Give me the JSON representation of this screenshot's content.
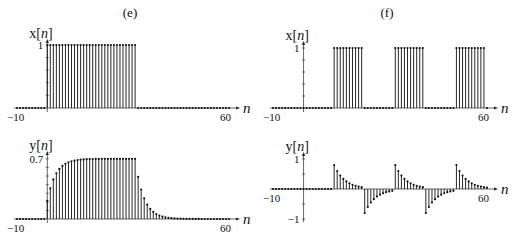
{
  "panels": [
    {
      "id": "e",
      "label": "(e)"
    },
    {
      "id": "f",
      "label": "(f)"
    }
  ],
  "chart_data": [
    {
      "type": "stem",
      "panel": "(e)",
      "title": "x[n]",
      "ylabel": "x[n]",
      "xlabel": "n",
      "xlim": [
        -10,
        60
      ],
      "x_tick_labels": [
        "-10",
        "60"
      ],
      "y_tick_labels": [
        "1"
      ],
      "ylim": [
        0,
        1
      ],
      "description": "Rectangular pulse: x[n]=1 for 0<=n<=29, else 0",
      "pulse": {
        "start": 0,
        "end": 29,
        "amplitude": 1
      }
    },
    {
      "type": "stem",
      "panel": "(e)",
      "title": "y[n]",
      "ylabel": "y[n]",
      "xlabel": "n",
      "xlim": [
        -10,
        60
      ],
      "x_tick_labels": [
        "-10",
        "60"
      ],
      "y_tick_labels": [
        "0.7"
      ],
      "ylim": [
        0,
        0.7
      ],
      "description": "First-order response: rises toward 0.7 from n=0, decays after n=29",
      "model": {
        "steady_state": 0.7,
        "pole": 0.7,
        "on_start": 0,
        "on_end": 29
      }
    },
    {
      "type": "stem",
      "panel": "(f)",
      "title": "x[n]",
      "ylabel": "x[n]",
      "xlabel": "n",
      "xlim": [
        -10,
        60
      ],
      "x_tick_labels": [
        "-10",
        "60"
      ],
      "y_tick_labels": [
        "1"
      ],
      "ylim": [
        0,
        1
      ],
      "description": "Periodic pulse train: x[n]=1 for n in [10,19],[30,39],[50,59]",
      "pulses": [
        [
          10,
          19
        ],
        [
          30,
          39
        ],
        [
          50,
          59
        ]
      ]
    },
    {
      "type": "stem",
      "panel": "(f)",
      "title": "y[n]",
      "ylabel": "y[n]",
      "xlabel": "n",
      "xlim": [
        -10,
        60
      ],
      "x_tick_labels": [
        "-10",
        "60"
      ],
      "y_tick_labels": [
        "1",
        "-1"
      ],
      "ylim": [
        -1,
        1
      ],
      "description": "Highpass response: +0.8 spike at rising edges (n=10,30,50) and -0.8 at falling edges (n=20,40), decaying geometrically",
      "model": {
        "peak": 0.8,
        "pole": 0.75,
        "rising_edges": [
          10,
          30,
          50
        ],
        "falling_edges": [
          20,
          40
        ]
      }
    }
  ],
  "axis_labels": {
    "x_n": "x[n]",
    "y_n": "y[n]",
    "n": "n",
    "tick_neg10": "−10",
    "tick_60": "60",
    "tick_1": "1",
    "tick_07": "0.7",
    "tick_neg1": "−1"
  }
}
